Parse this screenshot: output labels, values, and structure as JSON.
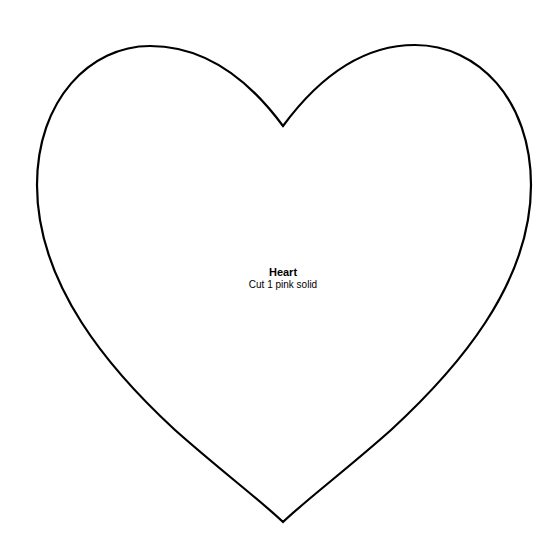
{
  "pattern": {
    "shape": "heart",
    "title": "Heart",
    "instruction": "Cut 1 pink solid",
    "stroke_color": "#000000",
    "fill_color": "#ffffff",
    "background_color": "#ffffff"
  }
}
